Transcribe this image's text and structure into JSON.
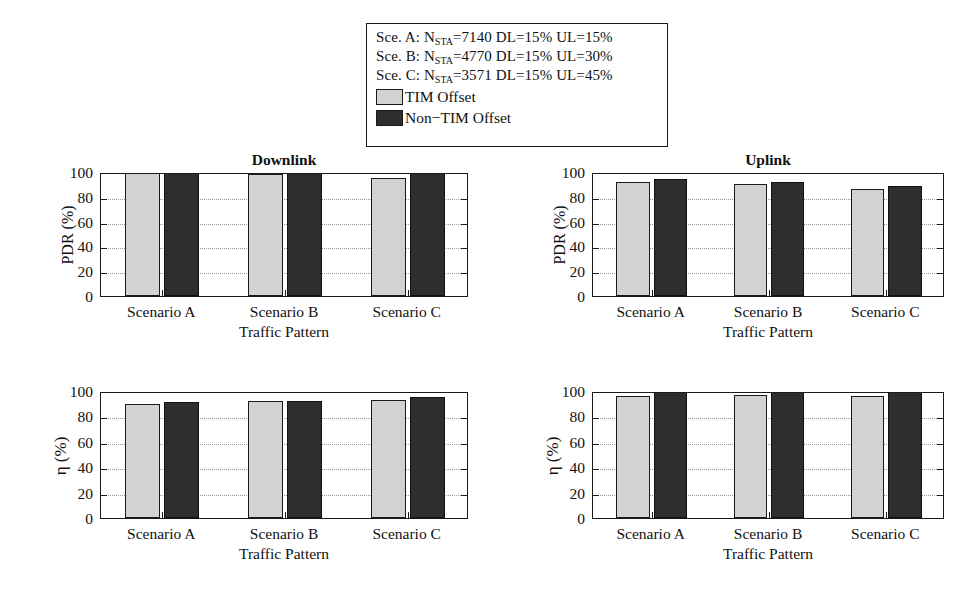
{
  "legend": {
    "scenarios": [
      {
        "prefix": "Sce. A: N",
        "sub": "STA",
        "rest": "=7140 DL=15% UL=15%"
      },
      {
        "prefix": "Sce. B: N",
        "sub": "STA",
        "rest": "=4770 DL=15% UL=30%"
      },
      {
        "prefix": "Sce. C: N",
        "sub": "STA",
        "rest": "=3571 DL=15% UL=45%"
      }
    ],
    "keys": [
      {
        "label": "TIM Offset",
        "color": "#d2d2d2",
        "swatch": "light"
      },
      {
        "label": "Non−TIM Offset",
        "color": "#2e2e2e",
        "swatch": "dark"
      }
    ]
  },
  "colors": {
    "tim_offset": "#d2d2d2",
    "non_tim_offset": "#2e2e2e",
    "axis": "#1a1a1a",
    "grid": "#9a9a9a",
    "background": "#ffffff"
  },
  "chart_data": [
    {
      "id": "downlink-pdr",
      "type": "bar",
      "title": "Downlink",
      "xlabel": "Traffic Pattern",
      "ylabel": "PDR (%)",
      "categories": [
        "Scenario A",
        "Scenario B",
        "Scenario C"
      ],
      "yticks": [
        0,
        20,
        40,
        60,
        80,
        100
      ],
      "ylim": [
        0,
        100
      ],
      "grid": true,
      "series": [
        {
          "name": "TIM Offset",
          "values": [
            100,
            98,
            95
          ]
        },
        {
          "name": "Non−TIM Offset",
          "values": [
            100,
            100,
            100
          ]
        }
      ]
    },
    {
      "id": "uplink-pdr",
      "type": "bar",
      "title": "Uplink",
      "xlabel": "Traffic Pattern",
      "ylabel": "PDR (%)",
      "categories": [
        "Scenario A",
        "Scenario B",
        "Scenario C"
      ],
      "yticks": [
        0,
        20,
        40,
        60,
        80,
        100
      ],
      "ylim": [
        0,
        100
      ],
      "grid": true,
      "series": [
        {
          "name": "TIM Offset",
          "values": [
            92,
            90,
            86
          ]
        },
        {
          "name": "Non−TIM Offset",
          "values": [
            94.5,
            92,
            88.5
          ]
        }
      ]
    },
    {
      "id": "downlink-eta",
      "type": "bar",
      "title": "",
      "xlabel": "Traffic Pattern",
      "ylabel": "η (%)",
      "categories": [
        "Scenario A",
        "Scenario B",
        "Scenario C"
      ],
      "yticks": [
        0,
        20,
        40,
        60,
        80,
        100
      ],
      "ylim": [
        0,
        100
      ],
      "grid": true,
      "series": [
        {
          "name": "TIM Offset",
          "values": [
            89.5,
            92.5,
            93
          ]
        },
        {
          "name": "Non−TIM Offset",
          "values": [
            91,
            92.5,
            95
          ]
        }
      ]
    },
    {
      "id": "uplink-eta",
      "type": "bar",
      "title": "",
      "xlabel": "Traffic Pattern",
      "ylabel": "η (%)",
      "categories": [
        "Scenario A",
        "Scenario B",
        "Scenario C"
      ],
      "yticks": [
        0,
        20,
        40,
        60,
        80,
        100
      ],
      "ylim": [
        0,
        100
      ],
      "grid": true,
      "series": [
        {
          "name": "TIM Offset",
          "values": [
            96,
            96.5,
            96
          ]
        },
        {
          "name": "Non−TIM Offset",
          "values": [
            100,
            100,
            100
          ]
        }
      ]
    }
  ],
  "layout": {
    "panels": [
      {
        "id": "downlink-pdr",
        "left": 100,
        "top": 173,
        "width": 368,
        "height": 124
      },
      {
        "id": "uplink-pdr",
        "left": 592,
        "top": 173,
        "width": 352,
        "height": 124
      },
      {
        "id": "downlink-eta",
        "left": 100,
        "top": 392,
        "width": 368,
        "height": 127
      },
      {
        "id": "uplink-eta",
        "left": 592,
        "top": 392,
        "width": 352,
        "height": 127
      }
    ]
  }
}
